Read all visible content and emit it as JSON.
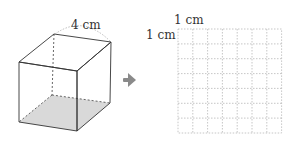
{
  "cube": {
    "edge_label": "4 cm",
    "edge_length_cm": 4
  },
  "arrow": {
    "icon": "arrow-right-icon",
    "color": "#8a8a8a"
  },
  "grid": {
    "column_label": "1 cm",
    "row_label": "1 cm",
    "columns": 7,
    "rows": 7,
    "line_color": "#b8b8b8"
  }
}
